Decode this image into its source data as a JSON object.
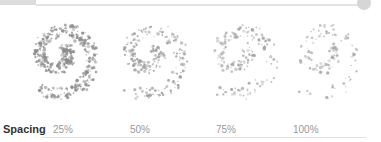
{
  "slider": {
    "fill_color": "#dcdcdc",
    "track_color": "#e3e3e3",
    "knob_color": "#d6d6d6"
  },
  "previews": [
    {
      "label": "25%",
      "density": 420,
      "dot_color": "#8a8a8a"
    },
    {
      "label": "50%",
      "density": 230,
      "dot_color": "#999999"
    },
    {
      "label": "75%",
      "density": 160,
      "dot_color": "#a3a3a3"
    },
    {
      "label": "100%",
      "density": 110,
      "dot_color": "#a8a8a8"
    }
  ],
  "spacing": {
    "title": "Spacing",
    "values": [
      "25%",
      "50%",
      "75%",
      "100%"
    ]
  }
}
